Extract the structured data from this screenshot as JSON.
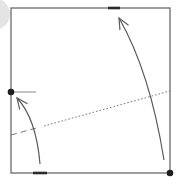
{
  "diagram": {
    "title": "Origami fold diagram step",
    "colors": {
      "background": "#ffffff",
      "paper_edge": "#6b6b6b",
      "arrow": "#5a5a5a",
      "dot": "#1e1e1e",
      "mark": "#2a2a2a",
      "fold_line": "#7a7a7a",
      "corner_disc": "#e4e4e4"
    },
    "paper": {
      "x": 11,
      "y": 8,
      "width": 159,
      "height": 165
    },
    "points": [
      {
        "name": "left-edge-point",
        "x": 11,
        "y": 92
      },
      {
        "name": "bottom-right-corner-point",
        "x": 170,
        "y": 173
      }
    ],
    "reference_line": {
      "x1": 11,
      "y1": 92,
      "x2": 36,
      "y2": 92
    },
    "edge_marks": [
      {
        "name": "top-edge-mark",
        "x1": 108,
        "y1": 8,
        "x2": 120,
        "y2": 8
      },
      {
        "name": "bottom-edge-mark",
        "x1": 33,
        "y1": 173,
        "x2": 47,
        "y2": 173
      }
    ],
    "fold_lines": [
      {
        "name": "valley-fold-dashed",
        "style": "dashed",
        "x1": 11,
        "y1": 135,
        "x2": 40,
        "y2": 127
      },
      {
        "name": "hidden-line-dotted",
        "style": "dotted",
        "x1": 44,
        "y1": 126,
        "x2": 170,
        "y2": 91
      }
    ],
    "arrows": [
      {
        "name": "left-fold-arrow",
        "path": "M40 164 C38 140 32 114 17 98",
        "head": {
          "x": 17,
          "y": 98
        }
      },
      {
        "name": "right-fold-arrow",
        "path": "M164 160 C156 110 142 58 119 18",
        "head": {
          "x": 119,
          "y": 18
        }
      }
    ]
  }
}
